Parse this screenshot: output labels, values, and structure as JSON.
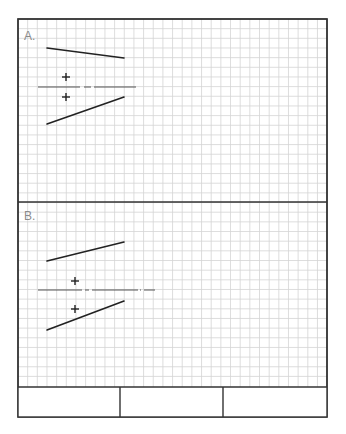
{
  "sheet": {
    "frame": {
      "x": 18,
      "y": 19,
      "width": 309,
      "height": 398
    },
    "grid": {
      "spacing": 9.66,
      "color": "#d4d4d4",
      "bottom": 387
    },
    "divider_y": 202,
    "colors": {
      "ink": "#222222",
      "border": "#333333",
      "label": "#8a8a8a"
    }
  },
  "panels": [
    {
      "label": "A.",
      "label_pos": {
        "x": 24,
        "y": 40
      },
      "lines": [
        {
          "x1": 47,
          "y1": 48,
          "x2": 124,
          "y2": 58
        },
        {
          "x1": 47,
          "y1": 124,
          "x2": 124,
          "y2": 97
        }
      ],
      "axis": {
        "y": 87,
        "segments": [
          [
            38,
            80
          ],
          [
            84,
            91
          ],
          [
            94,
            136
          ]
        ]
      },
      "crosses": [
        {
          "x": 66,
          "y": 77
        },
        {
          "x": 66,
          "y": 97
        }
      ]
    },
    {
      "label": "B.",
      "label_pos": {
        "x": 24,
        "y": 220
      },
      "lines": [
        {
          "x1": 47,
          "y1": 261,
          "x2": 124,
          "y2": 242
        },
        {
          "x1": 47,
          "y1": 330,
          "x2": 124,
          "y2": 301
        }
      ],
      "axis": {
        "y": 290,
        "segments": [
          [
            38,
            82
          ],
          [
            85,
            89
          ],
          [
            92,
            138
          ],
          [
            140,
            141
          ],
          [
            144,
            155
          ]
        ]
      },
      "crosses": [
        {
          "x": 75,
          "y": 281
        },
        {
          "x": 75,
          "y": 309
        }
      ]
    }
  ],
  "footer": {
    "top": 387,
    "bottom": 417,
    "dividers_x": [
      120,
      223
    ],
    "cells": [
      "",
      "",
      ""
    ]
  }
}
